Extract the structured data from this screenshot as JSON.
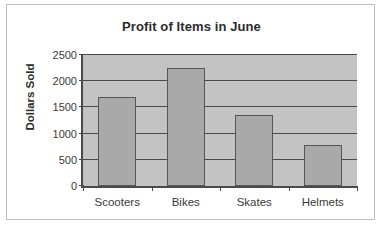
{
  "chart_data": {
    "type": "bar",
    "title": "Profit of Items in June",
    "xlabel": "",
    "ylabel": "Dollars Sold",
    "categories": [
      "Scooters",
      "Bikes",
      "Skates",
      "Helmets"
    ],
    "values": [
      1700,
      2250,
      1350,
      780
    ],
    "ylim": [
      0,
      2500
    ],
    "ytick_values": [
      0,
      500,
      1000,
      1500,
      2000,
      2500
    ],
    "ytick_labels": [
      "0",
      "500",
      "1000",
      "1500",
      "2000",
      "2500"
    ],
    "grid": true,
    "legend": false,
    "legend_position": "none",
    "colors": {
      "bar_fill": "#a9a9a9",
      "bar_border": "#565656",
      "plot_background": "#c3c3c3",
      "axis": "#4a4a4a",
      "text": "#3a3a3a",
      "title_text": "#2b2b2b",
      "frame_border": "#bdbdbd",
      "page_background": "#ffffff"
    }
  }
}
